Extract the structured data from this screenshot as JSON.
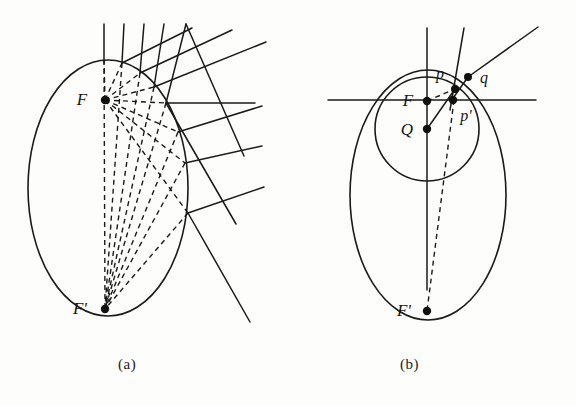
{
  "figure": {
    "kind": "geometric-diagram",
    "stroke_color": "#1a1a1a",
    "background_color": "#fdfdfc",
    "dash_color": "#1a1a1a"
  },
  "captions": {
    "panel_a": "(a)",
    "panel_b": "(b)"
  },
  "panel_a": {
    "labels": {
      "focus_near": "F",
      "focus_far": "F'"
    },
    "ellipse": {
      "cx": 108,
      "cy": 188,
      "rx": 80,
      "ry": 128
    },
    "focus_near_point": {
      "x": 105,
      "y": 100
    },
    "focus_far_point": {
      "x": 105,
      "y": 309
    },
    "reflection_points": [
      {
        "x": 104,
        "y": 60
      },
      {
        "x": 122,
        "y": 63
      },
      {
        "x": 140,
        "y": 73
      },
      {
        "x": 154,
        "y": 87
      },
      {
        "x": 166,
        "y": 103
      },
      {
        "x": 178,
        "y": 132
      },
      {
        "x": 185,
        "y": 163
      },
      {
        "x": 188,
        "y": 213
      }
    ],
    "incoming_ray_top_y": 24,
    "horizontal_ray_end_x": 255
  },
  "panel_b": {
    "labels": {
      "focus_near": "F",
      "focus_far": "F'",
      "center": "Q",
      "point_p": "p",
      "point_p_prime": "p'",
      "point_q": "q"
    },
    "ellipse": {
      "cx": 140,
      "cy": 195,
      "rx": 78,
      "ry": 125
    },
    "circle": {
      "cx": 139,
      "cy": 129,
      "r": 52
    },
    "focus_near_point": {
      "x": 139,
      "y": 101
    },
    "center_point": {
      "x": 139,
      "y": 129
    },
    "focus_far_point": {
      "x": 139,
      "y": 311
    },
    "point_p": {
      "x": 167,
      "y": 89
    },
    "point_p_prime": {
      "x": 166,
      "y": 100
    },
    "point_q": {
      "x": 180,
      "y": 77
    },
    "horizontal_line_y": 100,
    "horizontal_line_x1": 40,
    "horizontal_line_x2": 248,
    "vertical_line_top_y": 28,
    "vertical_line_bottom_y": 290
  }
}
